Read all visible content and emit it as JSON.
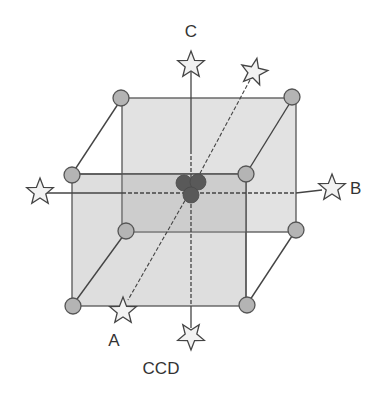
{
  "diagram": {
    "title": "CCD",
    "axes": {
      "a_label": "A",
      "b_label": "B",
      "c_label": "C"
    },
    "colors": {
      "face_back": "#e2e2e2",
      "face_front": "#d6d6d6",
      "overlap": "#c8c8c8",
      "edge": "#555555",
      "corner_point": "#b4b4b4",
      "center_point": "#585858",
      "star_fill": "#f2f2f2",
      "star_stroke": "#444444"
    },
    "point_types": {
      "corner": "factorial point (circle)",
      "axial": "axial/star point",
      "center": "center point"
    },
    "corner_points_count": 8,
    "axial_points_count": 6,
    "center_points_count": 3
  }
}
